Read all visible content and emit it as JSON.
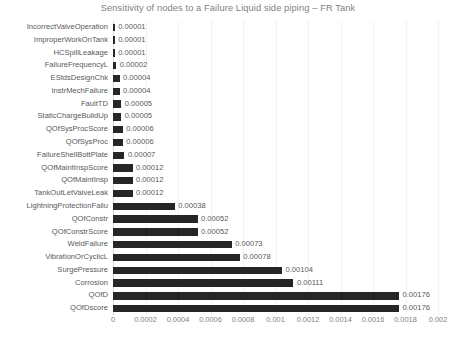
{
  "chart_data": {
    "type": "bar",
    "orientation": "horizontal",
    "title": "Sensitivity of nodes to a Failure Liquid side piping – FR Tank",
    "xlabel": "",
    "ylabel": "",
    "xlim": [
      0,
      0.002
    ],
    "grid": true,
    "legend": false,
    "bar_color": "#262626",
    "text_color": "#595959",
    "title_color": "#7f7f7f",
    "gridline_color": "#f2f2f2",
    "xticks": [
      "0",
      "0.0002",
      "0.0004",
      "0.0006",
      "0.0008",
      "0.001",
      "0.0012",
      "0.0014",
      "0.0016",
      "0.0018",
      "0.002"
    ],
    "xtick_values": [
      0,
      0.0002,
      0.0004,
      0.0006,
      0.0008,
      0.001,
      0.0012,
      0.0014,
      0.0016,
      0.0018,
      0.002
    ],
    "categories": [
      "IncorrectValveOperation",
      "ImproperWorkOnTank",
      "HCSpillLeakage",
      "FailureFrequencyL",
      "EStdsDesignChk",
      "InstrMechFailure",
      "FaultTD",
      "StaticChargeBuildUp",
      "QOfSysProcScore",
      "QOfSysProc",
      "FailureShellBottPlate",
      "QOfMaintInspScore",
      "QOfMaintInsp",
      "TankOutLetValveLeak",
      "LightningProtectionFailu",
      "QOfConstr",
      "QOfConstrScore",
      "WeldFailure",
      "VibrationOrCyclicL",
      "SurgePressure",
      "Corrosion",
      "QOfD",
      "QOfDscore"
    ],
    "values": [
      1e-05,
      1e-05,
      1e-05,
      2e-05,
      4e-05,
      4e-05,
      5e-05,
      5e-05,
      6e-05,
      6e-05,
      7e-05,
      0.00012,
      0.00012,
      0.00012,
      0.00038,
      0.00052,
      0.00052,
      0.00073,
      0.00078,
      0.00104,
      0.00111,
      0.00176,
      0.00176
    ],
    "value_labels": [
      "0.00001",
      "0.00001",
      "0.00001",
      "0.00002",
      "0.00004",
      "0.00004",
      "0.00005",
      "0.00005",
      "0.00006",
      "0.00006",
      "0.00007",
      "0.00012",
      "0.00012",
      "0.00012",
      "0.00038",
      "0.00052",
      "0.00052",
      "0.00073",
      "0.00078",
      "0.00104",
      "0.00111",
      "0.00176",
      "0.00176"
    ]
  }
}
